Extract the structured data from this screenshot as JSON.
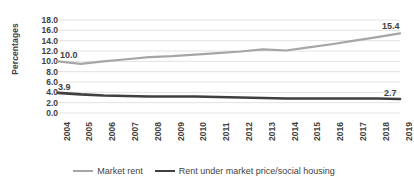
{
  "chart_data": {
    "type": "line",
    "title": "",
    "xlabel": "",
    "ylabel": "Percentages",
    "ylim": [
      0,
      18
    ],
    "ytick_step": 2,
    "yticks": [
      "0.0",
      "2.0",
      "4.0",
      "6.0",
      "8.0",
      "10.0",
      "12.0",
      "14.0",
      "16.0",
      "18.0"
    ],
    "grid": true,
    "legend_position": "bottom",
    "categories": [
      "2004",
      "2005",
      "2006",
      "2007",
      "2008",
      "2009",
      "2010",
      "2011",
      "2012",
      "2013",
      "2014",
      "2015",
      "2016",
      "2017",
      "2018",
      "2019"
    ],
    "series": [
      {
        "name": "Market rent",
        "color": "#a6a6a6",
        "width": 2.2,
        "values": [
          10.0,
          9.5,
          10.0,
          10.4,
          10.8,
          11.0,
          11.3,
          11.6,
          11.9,
          12.3,
          12.1,
          12.7,
          13.3,
          14.0,
          14.7,
          15.4
        ]
      },
      {
        "name": "Rent under market price/social housing",
        "color": "#3f3f3f",
        "width": 2.6,
        "values": [
          3.9,
          3.6,
          3.4,
          3.3,
          3.2,
          3.2,
          3.2,
          3.1,
          3.0,
          2.9,
          2.8,
          2.8,
          2.8,
          2.8,
          2.8,
          2.7
        ]
      }
    ],
    "annotations": [
      {
        "text": "10.0",
        "series": 0,
        "index": 0,
        "dx": 2,
        "dy": -11
      },
      {
        "text": "15.4",
        "series": 0,
        "index": 15,
        "dx": -18,
        "dy": -12
      },
      {
        "text": "3.9",
        "series": 1,
        "index": 0,
        "dx": 0,
        "dy": -11
      },
      {
        "text": "2.7",
        "series": 1,
        "index": 15,
        "dx": -16,
        "dy": -11
      }
    ]
  },
  "colors": {
    "grid": "#e2e2e2",
    "axis_text": "#3f3f3f",
    "market_rent": "#a6a6a6",
    "social_housing": "#3f3f3f",
    "background": "#ffffff"
  }
}
